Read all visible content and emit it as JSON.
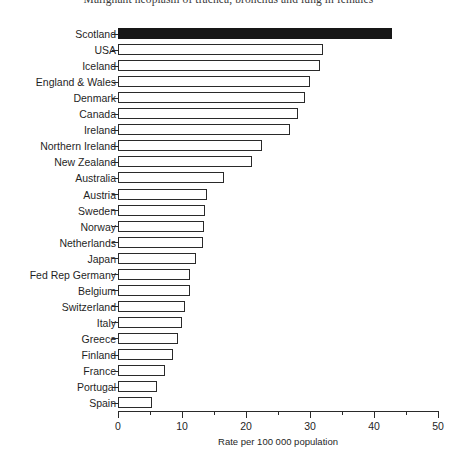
{
  "chart_data": {
    "type": "bar",
    "orientation": "horizontal",
    "title": "Malignant neoplasm of trachea, bronchus and lung in females",
    "xlabel": "Rate per 100 000 population",
    "ylabel": "",
    "xlim": [
      0,
      50
    ],
    "xticks": [
      0,
      10,
      20,
      30,
      40,
      50
    ],
    "xtick_labels": [
      "0",
      "10",
      "20",
      "30",
      "40",
      "50"
    ],
    "xminor_ticks": [
      5,
      15,
      25,
      35,
      45
    ],
    "grid": false,
    "legend": null,
    "highlight_category": "Scotland",
    "highlight_color": "#171717",
    "bar_color": "#ffffff",
    "bar_edge_color": "#2a2a2a",
    "categories": [
      "Scotland",
      "USA",
      "Iceland",
      "England & Wales",
      "Denmark",
      "Canada",
      "Ireland",
      "Northern Ireland",
      "New Zealand",
      "Australia",
      "Austria",
      "Sweden",
      "Norway",
      "Netherlands",
      "Japan",
      "Fed Rep Germany",
      "Belgium",
      "Switzerland",
      "Italy",
      "Greece",
      "Finland",
      "France",
      "Portugal",
      "Spain"
    ],
    "values": [
      42.8,
      32.0,
      31.6,
      30.0,
      29.2,
      28.1,
      26.9,
      22.5,
      20.9,
      16.6,
      13.9,
      13.6,
      13.4,
      13.3,
      12.2,
      11.3,
      11.2,
      10.5,
      10.0,
      9.4,
      8.6,
      7.3,
      6.1,
      5.3
    ]
  }
}
